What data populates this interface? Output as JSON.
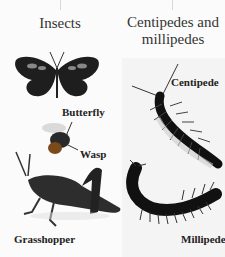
{
  "diagram": {
    "columns": [
      {
        "heading": "Insects",
        "items": [
          {
            "name": "Butterfly",
            "icon": "butterfly-icon"
          },
          {
            "name": "Wasp",
            "icon": "wasp-icon"
          },
          {
            "name": "Grasshopper",
            "icon": "grasshopper-icon"
          }
        ]
      },
      {
        "heading_line1": "Centipedes and",
        "heading_line2": "millipedes",
        "items": [
          {
            "name": "Centipede",
            "icon": "centipede-icon"
          },
          {
            "name": "Millipede",
            "icon": "millipede-icon"
          }
        ]
      }
    ],
    "colors": {
      "background": "#fbfbfb",
      "connector": "#d8d8d8",
      "text": "#2a2a2a"
    }
  }
}
